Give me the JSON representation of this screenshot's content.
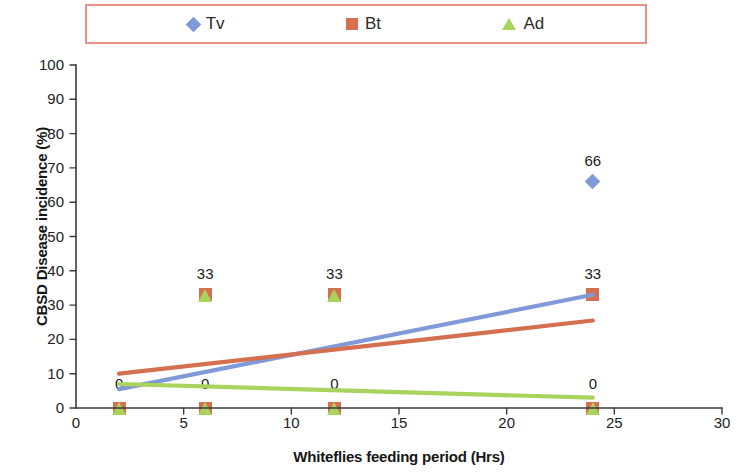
{
  "legend": {
    "entries": [
      {
        "label": "Tv",
        "marker": "diamond-marker-icon",
        "color": "#8099d8"
      },
      {
        "label": "Bt",
        "marker": "square-marker-icon",
        "color": "#d4704f"
      },
      {
        "label": "Ad",
        "marker": "triangle-marker-icon",
        "color": "#a8d45e"
      }
    ],
    "border_color": "#e8918a"
  },
  "chart_data": {
    "type": "scatter",
    "title": "",
    "xlabel": "Whiteflies feeding period (Hrs)",
    "ylabel": "CBSD Disease incidence (%)",
    "xlim": [
      0,
      30
    ],
    "ylim": [
      0,
      100
    ],
    "xticks": [
      0,
      5,
      10,
      15,
      20,
      25,
      30
    ],
    "yticks": [
      0,
      10,
      20,
      30,
      40,
      50,
      60,
      70,
      80,
      90,
      100
    ],
    "grid": false,
    "legend_position": "top",
    "x": [
      2,
      6,
      12,
      24
    ],
    "series": [
      {
        "name": "Tv",
        "color": "#8099d8",
        "marker": "diamond",
        "values": [
          0,
          0,
          0,
          66
        ],
        "trendline": {
          "x0": 2,
          "y0": 5.5,
          "x1": 24,
          "y1": 33.0
        }
      },
      {
        "name": "Bt",
        "color": "#d4704f",
        "marker": "square",
        "values": [
          0,
          33,
          33,
          33
        ],
        "trendline": {
          "x0": 2,
          "y0": 10.0,
          "x1": 24,
          "y1": 25.5
        }
      },
      {
        "name": "Ad",
        "color": "#a8d45e",
        "marker": "triangle",
        "values": [
          0,
          33,
          33,
          0
        ],
        "trendline": {
          "x0": 2,
          "y0": 7.0,
          "x1": 24,
          "y1": 3.0
        }
      }
    ],
    "data_labels": [
      {
        "text": "0",
        "x": 2,
        "y": 7
      },
      {
        "text": "0",
        "x": 6,
        "y": 7
      },
      {
        "text": "0",
        "x": 12,
        "y": 7
      },
      {
        "text": "0",
        "x": 24,
        "y": 7
      },
      {
        "text": "33",
        "x": 6,
        "y": 39
      },
      {
        "text": "33",
        "x": 12,
        "y": 39
      },
      {
        "text": "33",
        "x": 24,
        "y": 39
      },
      {
        "text": "66",
        "x": 24,
        "y": 72
      }
    ],
    "plotted_markers": [
      {
        "series": "Bt",
        "x": 2,
        "y": 0
      },
      {
        "series": "Ad",
        "x": 2,
        "y": 0
      },
      {
        "series": "Bt",
        "x": 6,
        "y": 0
      },
      {
        "series": "Ad",
        "x": 6,
        "y": 0
      },
      {
        "series": "Bt",
        "x": 12,
        "y": 0
      },
      {
        "series": "Ad",
        "x": 12,
        "y": 0
      },
      {
        "series": "Bt",
        "x": 24,
        "y": 0
      },
      {
        "series": "Ad",
        "x": 24,
        "y": 0
      },
      {
        "series": "Bt",
        "x": 6,
        "y": 33
      },
      {
        "series": "Ad",
        "x": 6,
        "y": 33
      },
      {
        "series": "Bt",
        "x": 12,
        "y": 33
      },
      {
        "series": "Ad",
        "x": 12,
        "y": 33
      },
      {
        "series": "Bt",
        "x": 24,
        "y": 33
      },
      {
        "series": "Tv",
        "x": 24,
        "y": 66
      }
    ]
  },
  "axis": {
    "line_color": "#3a3a3a"
  }
}
